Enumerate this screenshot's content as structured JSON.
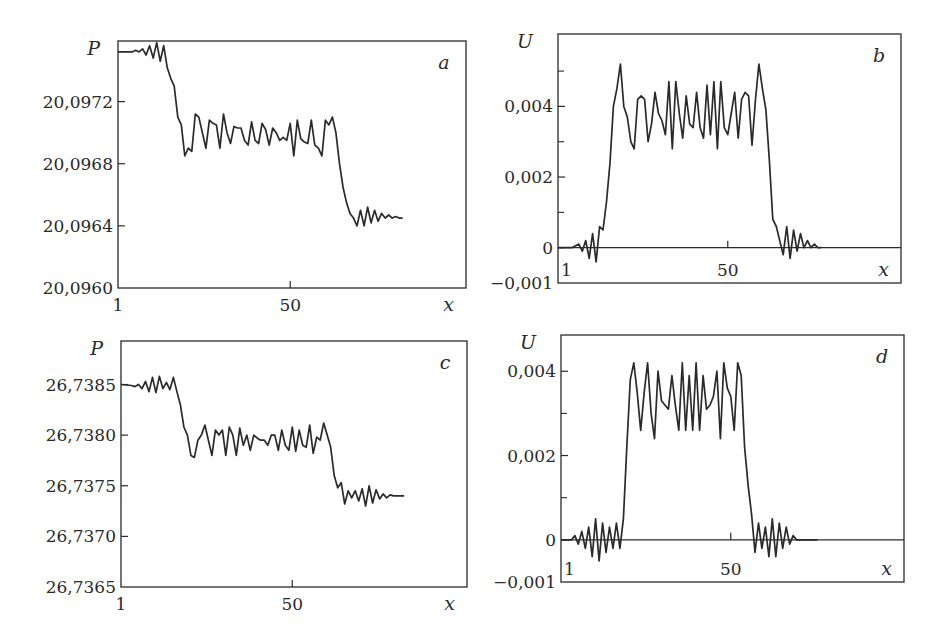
{
  "figure": {
    "line_color": "#2a2a2a",
    "background": "#ffffff"
  },
  "chart_data": [
    {
      "id": "a",
      "type": "line",
      "panel_label": "a",
      "ylabel": "P",
      "xlabel": "x",
      "xlim": [
        1,
        100
      ],
      "ylim": [
        20.096,
        20.09759
      ],
      "x_ticks": [
        {
          "value": 1,
          "label": "1"
        },
        {
          "value": 50,
          "label": "50"
        }
      ],
      "y_ticks": [
        {
          "value": 20.096,
          "label": "20,0960"
        },
        {
          "value": 20.0964,
          "label": "20,0964"
        },
        {
          "value": 20.0968,
          "label": "20,0968"
        },
        {
          "value": 20.0972,
          "label": "20,0972"
        }
      ],
      "zero_line": false,
      "box": {
        "x": 118,
        "y": 41,
        "w": 348,
        "h": 247
      },
      "x": [
        1,
        5,
        6,
        7,
        8,
        9,
        10,
        11,
        12,
        13,
        14,
        15,
        16,
        17,
        18,
        19,
        20,
        21,
        22,
        23,
        24,
        25,
        26,
        27,
        28,
        29,
        30,
        31,
        32,
        33,
        34,
        35,
        36,
        37,
        38,
        39,
        40,
        41,
        42,
        43,
        44,
        45,
        46,
        47,
        48,
        49,
        50,
        51,
        52,
        53,
        54,
        55,
        56,
        57,
        58,
        59,
        60,
        61,
        62,
        63,
        64,
        65,
        66,
        67,
        68,
        69,
        70,
        71,
        72,
        73,
        74,
        75,
        76,
        77,
        78,
        79,
        80,
        81,
        82,
        83,
        84,
        85,
        86,
        87,
        88,
        89,
        90,
        91,
        92,
        93,
        94,
        95,
        100
      ],
      "y": [
        20.09752,
        20.09752,
        20.09753,
        20.09752,
        20.09754,
        20.0975,
        20.09756,
        20.09748,
        20.09758,
        20.09746,
        20.09756,
        20.09742,
        20.09735,
        20.0973,
        20.0971,
        20.09705,
        20.09685,
        20.0969,
        20.09688,
        20.09712,
        20.0971,
        20.097,
        20.0969,
        20.09708,
        20.09706,
        20.09705,
        20.0969,
        20.09712,
        20.097,
        20.09693,
        20.09704,
        20.09703,
        20.09703,
        20.09695,
        20.09692,
        20.09707,
        20.09695,
        20.09693,
        20.09706,
        20.09702,
        20.09692,
        20.09703,
        20.097,
        20.09695,
        20.09697,
        20.09695,
        20.09706,
        20.09685,
        20.09708,
        20.09696,
        20.09694,
        20.09693,
        20.09708,
        20.09692,
        20.0969,
        20.09685,
        20.09708,
        20.09705,
        20.0971,
        20.097,
        20.0968,
        20.09665,
        20.09655,
        20.09648,
        20.09645,
        20.0964,
        20.0965,
        20.0964,
        20.09652,
        20.09642,
        20.0965,
        20.09643,
        20.09648,
        20.09645,
        20.09647,
        20.09645,
        20.09646,
        20.09645,
        20.09645
      ]
    },
    {
      "id": "b",
      "type": "line",
      "panel_label": "b",
      "ylabel": "U",
      "xlabel": "x",
      "xlim": [
        1,
        100
      ],
      "ylim": [
        -0.001,
        0.00605
      ],
      "x_ticks": [
        {
          "value": 1,
          "label": "1"
        },
        {
          "value": 50,
          "label": "50"
        }
      ],
      "y_ticks": [
        {
          "value": -0.001,
          "label": "−0,001"
        },
        {
          "value": 0,
          "label": "0"
        },
        {
          "value": 0.002,
          "label": "0,002"
        },
        {
          "value": 0.004,
          "label": "0,004"
        }
      ],
      "minor_y_ticks": [
        0.001,
        0.003,
        0.005
      ],
      "zero_line": true,
      "box": {
        "x": 558,
        "y": 34,
        "w": 343,
        "h": 249
      },
      "x": [
        1,
        5,
        7,
        8,
        9,
        10,
        11,
        12,
        13,
        14,
        15,
        16,
        17,
        18,
        19,
        20,
        21,
        22,
        23,
        24,
        25,
        26,
        27,
        28,
        29,
        30,
        31,
        32,
        33,
        34,
        35,
        36,
        37,
        38,
        39,
        40,
        41,
        42,
        43,
        44,
        45,
        46,
        47,
        48,
        49,
        50,
        51,
        52,
        53,
        54,
        55,
        56,
        57,
        58,
        59,
        60,
        61,
        62,
        63,
        64,
        65,
        66,
        67,
        68,
        69,
        70,
        71,
        72,
        73,
        74,
        75,
        76,
        77,
        78,
        79,
        80,
        81,
        82,
        83,
        84,
        85,
        86,
        87,
        88,
        89,
        90,
        91,
        92,
        93,
        95,
        100
      ],
      "y": [
        0,
        0,
        0.0001,
        -0.0001,
        0.0002,
        -0.0003,
        0.0004,
        -0.0004,
        0.0006,
        0.0005,
        0.0013,
        0.0024,
        0.004,
        0.0045,
        0.0052,
        0.004,
        0.0037,
        0.003,
        0.0028,
        0.0042,
        0.0043,
        0.0042,
        0.003,
        0.0035,
        0.0044,
        0.0038,
        0.0036,
        0.0032,
        0.0047,
        0.0028,
        0.0047,
        0.0038,
        0.0031,
        0.0043,
        0.0035,
        0.0034,
        0.0044,
        0.0034,
        0.0031,
        0.0046,
        0.0032,
        0.0047,
        0.0028,
        0.0047,
        0.0034,
        0.0032,
        0.0038,
        0.0044,
        0.0031,
        0.0042,
        0.0044,
        0.0043,
        0.0029,
        0.0042,
        0.0052,
        0.0045,
        0.0039,
        0.0025,
        0.0008,
        0.0006,
        0.0002,
        -0.0002,
        0.0006,
        -0.0003,
        0.0005,
        -0.0001,
        0.0004,
        0,
        0.0002,
        0,
        0.0001,
        0,
        0
      ]
    },
    {
      "id": "c",
      "type": "line",
      "panel_label": "c",
      "ylabel": "P",
      "xlabel": "x",
      "xlim": [
        1,
        100
      ],
      "ylim": [
        26.7365,
        26.73893
      ],
      "x_ticks": [
        {
          "value": 1,
          "label": "1"
        },
        {
          "value": 50,
          "label": "50"
        }
      ],
      "y_ticks": [
        {
          "value": 26.7365,
          "label": "26,7365"
        },
        {
          "value": 26.737,
          "label": "26,7370"
        },
        {
          "value": 26.7375,
          "label": "26,7375"
        },
        {
          "value": 26.738,
          "label": "26,7380"
        },
        {
          "value": 26.7385,
          "label": "26,7385"
        }
      ],
      "zero_line": false,
      "box": {
        "x": 121,
        "y": 341,
        "w": 346,
        "h": 246
      },
      "x": [
        1,
        4,
        5,
        6,
        7,
        8,
        9,
        10,
        11,
        12,
        13,
        14,
        15,
        16,
        17,
        18,
        19,
        20,
        21,
        22,
        23,
        24,
        25,
        26,
        27,
        28,
        29,
        30,
        31,
        32,
        33,
        34,
        35,
        36,
        37,
        38,
        39,
        40,
        41,
        42,
        43,
        44,
        45,
        46,
        47,
        48,
        49,
        50,
        51,
        52,
        53,
        54,
        55,
        56,
        57,
        58,
        59,
        60,
        61,
        62,
        63,
        64,
        65,
        66,
        67,
        68,
        69,
        70,
        71,
        72,
        73,
        74,
        75,
        76,
        77,
        78,
        79,
        80,
        81,
        82,
        83,
        84,
        85,
        86,
        87,
        88,
        89,
        90,
        91,
        92,
        93,
        94,
        95,
        100
      ],
      "y": [
        26.7385,
        26.73849,
        26.73848,
        26.7385,
        26.73846,
        26.73853,
        26.73843,
        26.73857,
        26.73842,
        26.73858,
        26.73846,
        26.73852,
        26.73845,
        26.73857,
        26.73843,
        26.7383,
        26.73808,
        26.738,
        26.7378,
        26.73778,
        26.73795,
        26.738,
        26.7381,
        26.73795,
        26.7378,
        26.73805,
        26.738,
        26.73805,
        26.7378,
        26.73808,
        26.738,
        26.7378,
        26.73807,
        26.7379,
        26.738,
        26.73785,
        26.738,
        26.73797,
        26.73795,
        26.73795,
        26.7379,
        26.738,
        26.738,
        26.73785,
        26.73805,
        26.7379,
        26.73785,
        26.73808,
        26.73784,
        26.73805,
        26.7379,
        26.73788,
        26.7381,
        26.73782,
        26.73798,
        26.73795,
        26.73812,
        26.738,
        26.73788,
        26.7376,
        26.73748,
        26.73753,
        26.73732,
        26.73745,
        26.73738,
        26.73745,
        26.73735,
        26.73747,
        26.7373,
        26.7375,
        26.73733,
        26.73746,
        26.73737,
        26.73742,
        26.73738,
        26.73741,
        26.7374,
        26.7374,
        26.7374,
        26.7374
      ]
    },
    {
      "id": "d",
      "type": "line",
      "panel_label": "d",
      "ylabel": "U",
      "xlabel": "x",
      "xlim": [
        1,
        100
      ],
      "ylim": [
        -0.001,
        0.00486
      ],
      "x_ticks": [
        {
          "value": 1,
          "label": "1"
        },
        {
          "value": 50,
          "label": "50"
        }
      ],
      "y_ticks": [
        {
          "value": -0.001,
          "label": "−0,001"
        },
        {
          "value": 0,
          "label": "0"
        },
        {
          "value": 0.002,
          "label": "0,002"
        },
        {
          "value": 0.004,
          "label": "0,004"
        }
      ],
      "minor_y_ticks": [
        0.001,
        0.003
      ],
      "zero_line": true,
      "box": {
        "x": 561,
        "y": 335,
        "w": 343,
        "h": 247
      },
      "x": [
        1,
        4,
        5,
        6,
        7,
        8,
        9,
        10,
        11,
        12,
        13,
        14,
        15,
        16,
        17,
        18,
        19,
        20,
        21,
        22,
        23,
        24,
        25,
        26,
        27,
        28,
        29,
        30,
        31,
        32,
        33,
        34,
        35,
        36,
        37,
        38,
        39,
        40,
        41,
        42,
        43,
        44,
        45,
        46,
        47,
        48,
        49,
        50,
        51,
        52,
        53,
        54,
        55,
        56,
        57,
        58,
        59,
        60,
        61,
        62,
        63,
        64,
        65,
        66,
        67,
        68,
        69,
        70,
        71,
        72,
        73,
        74,
        75,
        76,
        77,
        78,
        79,
        80,
        81,
        82,
        83,
        84,
        85,
        86,
        87,
        88,
        89,
        90,
        91,
        92,
        93,
        95,
        100
      ],
      "y": [
        0,
        0,
        0.0001,
        -0.0001,
        0.0002,
        -0.0002,
        0.0003,
        -0.0004,
        0.0005,
        -0.0005,
        0.0004,
        -0.0003,
        0.0003,
        -0.0002,
        0.0004,
        -0.0002,
        0.0005,
        0.0022,
        0.0038,
        0.0042,
        0.0035,
        0.0026,
        0.0035,
        0.0042,
        0.003,
        0.0024,
        0.004,
        0.0033,
        0.0032,
        0.0031,
        0.0039,
        0.0032,
        0.0026,
        0.0042,
        0.0026,
        0.0039,
        0.0026,
        0.0042,
        0.0026,
        0.0039,
        0.0031,
        0.0032,
        0.0034,
        0.004,
        0.0024,
        0.0042,
        0.0036,
        0.0034,
        0.0026,
        0.0042,
        0.0039,
        0.0022,
        0.0013,
        0.0006,
        -0.0003,
        0.0004,
        -0.0002,
        0.0003,
        -0.0004,
        0.0005,
        -0.0004,
        0.0004,
        -0.0002,
        0.0003,
        -0.0001,
        0.0001,
        0,
        0,
        0,
        0,
        0,
        0,
        0
      ]
    }
  ]
}
